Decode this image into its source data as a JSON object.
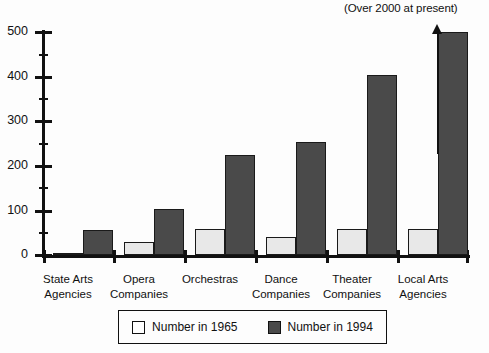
{
  "chart_data": {
    "type": "bar",
    "title": "",
    "xlabel": "",
    "ylabel": "",
    "ylim": [
      0,
      500
    ],
    "y_ticks_major": [
      0,
      100,
      200,
      300,
      400,
      500
    ],
    "y_ticks_minor": [
      50,
      150,
      250,
      350,
      450
    ],
    "grid": false,
    "legend_position": "bottom",
    "categories": [
      "State Arts\nAgencies",
      "Opera\nCompanies",
      "Orchestras",
      "Dance\nCompanies",
      "Theater\nCompanies",
      "Local Arts\nAgencies"
    ],
    "category_lines": [
      [
        "State Arts",
        "Agencies"
      ],
      [
        "Opera",
        "Companies"
      ],
      [
        "Orchestras",
        ""
      ],
      [
        "Dance",
        "Companies"
      ],
      [
        "Theater",
        "Companies"
      ],
      [
        "Local Arts",
        "Agencies"
      ]
    ],
    "series": [
      {
        "name": "Number in 1965",
        "color": "#e8e8e8",
        "values": [
          5,
          30,
          58,
          40,
          58,
          58
        ]
      },
      {
        "name": "Number in 1994",
        "color": "#4a4a4a",
        "values": [
          55,
          103,
          225,
          253,
          403,
          500
        ]
      }
    ],
    "annotations": [
      {
        "text": "(Over 2000 at present)",
        "target_category": "Local Arts Agencies",
        "target_series": "Number in 1994",
        "arrow": "up"
      }
    ]
  },
  "legend": {
    "items": [
      {
        "label": "Number in 1965",
        "swatch": "light"
      },
      {
        "label": "Number in 1994",
        "swatch": "dark"
      }
    ]
  },
  "axis": {
    "y_tick_labels": [
      "500",
      "400",
      "300",
      "200",
      "100",
      "0"
    ]
  }
}
